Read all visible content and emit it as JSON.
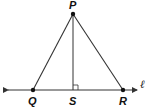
{
  "diagram": {
    "type": "geometry",
    "points": {
      "P": {
        "label": "P",
        "x": 73,
        "y": 14
      },
      "Q": {
        "label": "Q",
        "x": 33,
        "y": 90
      },
      "S": {
        "label": "S",
        "x": 73,
        "y": 90
      },
      "R": {
        "label": "R",
        "x": 123,
        "y": 90
      }
    },
    "line_label": "ℓ",
    "segments": [
      "PQ",
      "PR",
      "PS"
    ],
    "right_angle_at": "S",
    "colors": {
      "stroke": "#333333",
      "text": "#111111"
    }
  }
}
